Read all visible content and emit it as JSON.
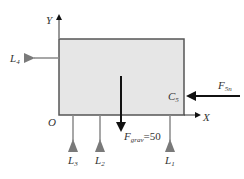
{
  "diagram": {
    "type": "free-body-diagram",
    "body": {
      "fill": "#e6e6e6",
      "stroke": "#555555",
      "x": 59,
      "y": 39,
      "width": 125,
      "height": 76
    },
    "axes": {
      "y_label": "Y",
      "x_label": "X",
      "origin_label": "O"
    },
    "forces": {
      "gravity": {
        "label_main": "F",
        "label_sub": "grav",
        "label_value": "=50",
        "direction": "down"
      },
      "applied": {
        "label_main": "F",
        "label_sub": "5n",
        "direction": "left"
      }
    },
    "points": {
      "c5": {
        "label_main": "C",
        "label_sub": "5"
      }
    },
    "supports": [
      {
        "id": "L1",
        "label_main": "L",
        "label_sub": "1",
        "position": "bottom"
      },
      {
        "id": "L2",
        "label_main": "L",
        "label_sub": "2",
        "position": "bottom"
      },
      {
        "id": "L3",
        "label_main": "L",
        "label_sub": "3",
        "position": "bottom"
      },
      {
        "id": "L4",
        "label_main": "L",
        "label_sub": "4",
        "position": "left"
      }
    ],
    "colors": {
      "support": "#7a7a7a",
      "force": "#111111",
      "axis": "#333333",
      "text": "#333333"
    }
  }
}
